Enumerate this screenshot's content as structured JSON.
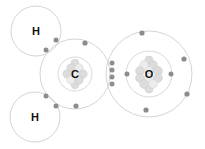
{
  "diagram": {
    "molecule": "CH2O",
    "background_color": "#ffffff",
    "shell_color": "#cfcfcf",
    "electron_color": "#8c8c8c",
    "nucleus_color": "#dcdcdc",
    "label_color": "#111111"
  },
  "atoms": [
    {
      "id": "hydrogen-top",
      "symbol": "H",
      "name": "hydrogen",
      "center": {
        "x": 36,
        "y": 31
      },
      "shells": [
        {
          "radius": 25
        }
      ],
      "nucleus_radius": 0,
      "label_offset_y": 0
    },
    {
      "id": "carbon",
      "symbol": "C",
      "name": "carbon",
      "center": {
        "x": 75,
        "y": 74
      },
      "shells": [
        {
          "radius": 17
        },
        {
          "radius": 35
        }
      ],
      "nucleus_radius": 10,
      "label_offset_y": 0
    },
    {
      "id": "hydrogen-bottom",
      "symbol": "H",
      "name": "hydrogen",
      "center": {
        "x": 35,
        "y": 117
      },
      "shells": [
        {
          "radius": 25
        }
      ],
      "nucleus_radius": 0,
      "label_offset_y": 0
    },
    {
      "id": "oxygen",
      "symbol": "O",
      "name": "oxygen",
      "center": {
        "x": 149,
        "y": 74
      },
      "shells": [
        {
          "radius": 23
        },
        {
          "radius": 43
        }
      ],
      "nucleus_radius": 13,
      "label_offset_y": 0
    }
  ],
  "electrons": [
    {
      "group": "carbon-outer",
      "x": 85,
      "y": 43
    },
    {
      "group": "carbon-outer",
      "x": 76,
      "y": 106
    },
    {
      "group": "oxygen-outer",
      "x": 142,
      "y": 33
    },
    {
      "group": "oxygen-outer",
      "x": 184,
      "y": 59
    },
    {
      "group": "oxygen-outer",
      "x": 187,
      "y": 94
    },
    {
      "group": "oxygen-outer",
      "x": 146,
      "y": 110
    },
    {
      "group": "oxygen-inner",
      "x": 127,
      "y": 74
    },
    {
      "group": "oxygen-inner",
      "x": 171,
      "y": 74
    },
    {
      "group": "bond-ch-top",
      "x": 56,
      "y": 40
    },
    {
      "group": "bond-ch-top",
      "x": 46,
      "y": 50
    },
    {
      "group": "bond-ch-bottom",
      "x": 46,
      "y": 96
    },
    {
      "group": "bond-ch-bottom",
      "x": 56,
      "y": 106
    },
    {
      "group": "bond-co-double",
      "x": 112,
      "y": 63
    },
    {
      "group": "bond-co-double",
      "x": 112,
      "y": 70
    },
    {
      "group": "bond-co-double",
      "x": 112,
      "y": 77
    },
    {
      "group": "bond-co-double",
      "x": 112,
      "y": 84
    }
  ],
  "nucleons": {
    "carbon": [
      {
        "x": 71,
        "y": 68,
        "r": 4.2
      },
      {
        "x": 79,
        "y": 68,
        "r": 4.2
      },
      {
        "x": 67,
        "y": 74,
        "r": 4.2
      },
      {
        "x": 75,
        "y": 74,
        "r": 4.2
      },
      {
        "x": 83,
        "y": 74,
        "r": 4.2
      },
      {
        "x": 71,
        "y": 80,
        "r": 4.2
      },
      {
        "x": 79,
        "y": 80,
        "r": 4.2
      },
      {
        "x": 75,
        "y": 63,
        "r": 3.8
      },
      {
        "x": 75,
        "y": 85,
        "r": 3.8
      }
    ],
    "oxygen": [
      {
        "x": 144,
        "y": 65,
        "r": 4.4
      },
      {
        "x": 153,
        "y": 65,
        "r": 4.4
      },
      {
        "x": 140,
        "y": 71,
        "r": 4.4
      },
      {
        "x": 149,
        "y": 71,
        "r": 4.4
      },
      {
        "x": 158,
        "y": 71,
        "r": 4.4
      },
      {
        "x": 140,
        "y": 78,
        "r": 4.4
      },
      {
        "x": 149,
        "y": 78,
        "r": 4.4
      },
      {
        "x": 158,
        "y": 78,
        "r": 4.4
      },
      {
        "x": 144,
        "y": 84,
        "r": 4.4
      },
      {
        "x": 153,
        "y": 84,
        "r": 4.4
      },
      {
        "x": 149,
        "y": 60,
        "r": 4.0
      },
      {
        "x": 149,
        "y": 89,
        "r": 4.0
      }
    ]
  },
  "labels": {
    "hydrogen_top": "H",
    "hydrogen_bottom": "H",
    "carbon": "C",
    "oxygen": "O"
  }
}
